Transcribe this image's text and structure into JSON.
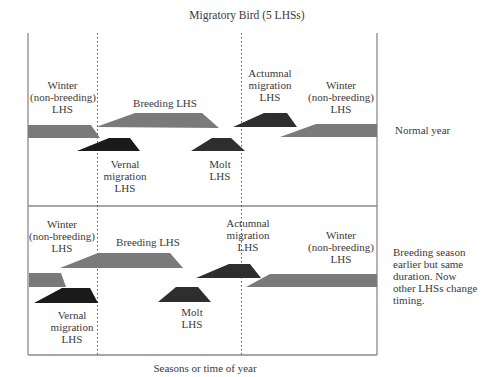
{
  "title": "Migratory Bird (5 LHSs)",
  "xlabel": "Seasons or time of year",
  "colors": {
    "winter": "#7a7a7a",
    "breeding": "#7a7a7a",
    "migration": "#1c1c1c",
    "molt": "#2e2e2e",
    "autumn": "#2e2e2e",
    "frame": "#8a8a8a"
  },
  "panels": [
    {
      "side_note": "Normal year",
      "labels": {
        "winter_left": [
          "Winter",
          "(non-breeding)",
          "LHS"
        ],
        "breeding": "Breeding LHS",
        "vernal": [
          "Vernal",
          "migration",
          "LHS"
        ],
        "molt": [
          "Molt",
          "LHS"
        ],
        "autumn": [
          "Actumnal",
          "migration",
          "LHS"
        ],
        "winter_right": [
          "Winter",
          "(non-breeding)",
          "LHS"
        ]
      }
    },
    {
      "side_note": [
        "Breeding season",
        "earlier but same",
        "duration. Now",
        "other LHSs change",
        "timing."
      ],
      "labels": {
        "winter_left": [
          "Winter",
          "(non-breeding)",
          "LHS"
        ],
        "breeding": "Breeding LHS",
        "vernal": [
          "Vernal",
          "migration",
          "LHS"
        ],
        "molt": [
          "Molt",
          "LHS"
        ],
        "autumn": [
          "Actumnal",
          "migration",
          "LHS"
        ],
        "winter_right": [
          "Winter",
          "(non-breeding)",
          "LHS"
        ]
      }
    }
  ]
}
